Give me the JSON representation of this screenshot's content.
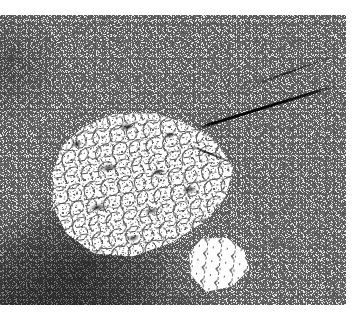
{
  "figure": {
    "kind": "photomicrograph",
    "rendering": "black-and-white halftone photograph",
    "caption": ""
  },
  "plate": {
    "name": "photo-plate",
    "left": 0,
    "top": 15,
    "width": 346,
    "height": 290,
    "background_hex": "#d8d8d8"
  },
  "margins": {
    "top_hex": "#ffffff",
    "bottom_hex": "#ffffff",
    "right_hex": "#ffffff",
    "top_height": 15,
    "bottom_height": 22,
    "right_width": 13
  },
  "palette": {
    "highlight_hex": "#ffffff",
    "light_grey_hex": "#e6e6e6",
    "mid_grey_hex": "#9a9a9a",
    "dark_grey_hex": "#4a4a4a",
    "shadow_hex": "#111111"
  },
  "features": [
    {
      "id": "groundmass",
      "label": "fine-grained speckled groundmass",
      "description": "dense salt-and-pepper matrix of light and dark mineral grains filling the whole field",
      "tone": "mid grey"
    },
    {
      "id": "phenocryst",
      "label": "large pale phenocryst",
      "description": "bright tabular crystal, roughly rhombic, occupying the centre-left of the field and dotted with small dark inclusions",
      "tone": "white",
      "left": 50,
      "top": 92,
      "width": 186,
      "height": 150,
      "rotation_deg": -9
    },
    {
      "id": "phenocryst-lobe",
      "label": "secondary bright crystal lobe",
      "description": "smaller pale grain at the lower-right margin of the main phenocryst",
      "tone": "white",
      "left": 188,
      "top": 222,
      "width": 62,
      "height": 56,
      "rotation_deg": 6
    },
    {
      "id": "fracture",
      "label": "dark diagonal fracture",
      "description": "sharp near-black linear crack running down-right across the upper right quadrant",
      "tone": "black",
      "rotation_deg": -17
    },
    {
      "id": "mafic-zone",
      "label": "dark mafic-rich zone",
      "description": "broad darker band of clustered mafic grains across the lower-left of the field",
      "tone": "dark grey"
    },
    {
      "id": "shoulder-shadow",
      "label": "upper-left tonal shadow",
      "description": "slightly darker mottled shoulder along the upper-left edge",
      "tone": "dark grey"
    }
  ]
}
